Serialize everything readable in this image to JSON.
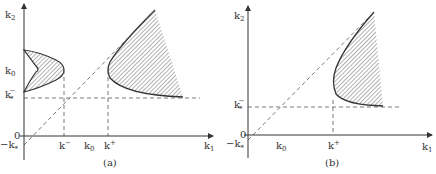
{
  "figure": {
    "panels": [
      {
        "id": "a",
        "caption": "(a)",
        "y_axis_label": "k",
        "y_axis_sub": "2",
        "x_axis_label": "k",
        "x_axis_sub": "1",
        "y_ticks": [
          {
            "text": "k",
            "sub": "0",
            "sup": ""
          },
          {
            "text": "k",
            "sub": "*",
            "sup": "−"
          },
          {
            "text": "0",
            "sub": "",
            "sup": ""
          },
          {
            "text": "−k",
            "sub": "*",
            "sup": ""
          }
        ],
        "x_ticks": [
          {
            "text": "k",
            "sup": "−",
            "sub": ""
          },
          {
            "text": "k",
            "sup": "",
            "sub": "0"
          },
          {
            "text": "k",
            "sup": "+",
            "sub": ""
          }
        ],
        "regions": [
          "left-shaded-region",
          "right-shaded-region"
        ]
      },
      {
        "id": "b",
        "caption": "(b)",
        "y_axis_label": "k",
        "y_axis_sub": "2",
        "x_axis_label": "k",
        "x_axis_sub": "1",
        "y_ticks": [
          {
            "text": "k",
            "sub": "*",
            "sup": "−"
          },
          {
            "text": "0",
            "sub": "",
            "sup": ""
          },
          {
            "text": "−k",
            "sub": "*",
            "sup": ""
          }
        ],
        "x_ticks": [
          {
            "text": "k",
            "sup": "",
            "sub": "0"
          },
          {
            "text": "k",
            "sup": "+",
            "sub": ""
          }
        ],
        "regions": [
          "shaded-region"
        ]
      }
    ],
    "colors": {
      "line": "#333333",
      "dash": "#555555",
      "hatch": "#444444",
      "background": "#ffffff"
    }
  }
}
